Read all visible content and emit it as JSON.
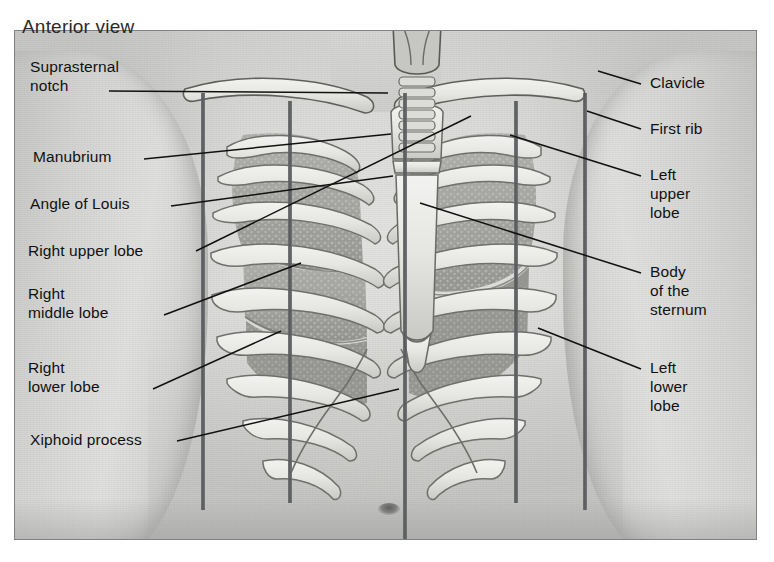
{
  "figure": {
    "title": "Anterior view",
    "view_label": "Anterior view",
    "frame_color": "#7e8285",
    "ink_color": "#111111",
    "reference_line_color": "#4e5052",
    "background_color": "#ffffff"
  },
  "labels_left": [
    {
      "id": "suprasternal-notch",
      "text": "Suprasternal\nnotch",
      "x": 30,
      "y": 57,
      "leader_from": [
        108,
        90
      ],
      "leader_to": [
        387,
        92
      ]
    },
    {
      "id": "manubrium",
      "text": "Manubrium",
      "x": 33,
      "y": 147,
      "leader_from": [
        143,
        158
      ],
      "leader_to": [
        390,
        133
      ]
    },
    {
      "id": "angle-of-louis",
      "text": "Angle of Louis",
      "x": 30,
      "y": 194,
      "leader_from": [
        170,
        205
      ],
      "leader_to": [
        392,
        175
      ]
    },
    {
      "id": "right-upper-lobe",
      "text": "Right upper lobe",
      "x": 28,
      "y": 241,
      "leader_from": [
        195,
        250
      ],
      "leader_to": [
        470,
        115
      ]
    },
    {
      "id": "right-middle-lobe",
      "text": "Right\nmiddle lobe",
      "x": 28,
      "y": 284,
      "leader_from": [
        163,
        314
      ],
      "leader_to": [
        300,
        262
      ]
    },
    {
      "id": "right-lower-lobe",
      "text": "Right\nlower lobe",
      "x": 28,
      "y": 358,
      "leader_from": [
        152,
        388
      ],
      "leader_to": [
        280,
        330
      ]
    },
    {
      "id": "xiphoid-process",
      "text": "Xiphoid process",
      "x": 30,
      "y": 430,
      "leader_from": [
        176,
        440
      ],
      "leader_to": [
        398,
        388
      ]
    }
  ],
  "labels_right": [
    {
      "id": "clavicle",
      "text": "Clavicle",
      "x": 650,
      "y": 73,
      "leader_from": [
        640,
        83
      ],
      "leader_to": [
        597,
        70
      ]
    },
    {
      "id": "first-rib",
      "text": "First rib",
      "x": 650,
      "y": 119,
      "leader_from": [
        640,
        128
      ],
      "leader_to": [
        586,
        110
      ]
    },
    {
      "id": "left-upper-lobe",
      "text": "Left\nupper\nlobe",
      "x": 650,
      "y": 165,
      "leader_from": [
        640,
        175
      ],
      "leader_to": [
        509,
        134
      ]
    },
    {
      "id": "body-of-sternum",
      "text": "Body\nof the\nsternum",
      "x": 650,
      "y": 262,
      "leader_from": [
        640,
        272
      ],
      "leader_to": [
        419,
        202
      ]
    },
    {
      "id": "left-lower-lobe",
      "text": "Left\nlower\nlobe",
      "x": 650,
      "y": 358,
      "leader_from": [
        640,
        368
      ],
      "leader_to": [
        537,
        327
      ]
    }
  ],
  "reference_lines": [
    {
      "id": "right-anterior-axillary-line",
      "x": 200,
      "y_top": 92,
      "y_bottom": 509
    },
    {
      "id": "right-midclavicular-line",
      "x": 287,
      "y_top": 100,
      "y_bottom": 502
    },
    {
      "id": "midsternal-line",
      "x": 402,
      "y_top": 92,
      "y_bottom": 520
    },
    {
      "id": "left-midclavicular-line",
      "x": 513,
      "y_top": 100,
      "y_bottom": 502
    },
    {
      "id": "left-anterior-axillary-line",
      "x": 582,
      "y_top": 92,
      "y_bottom": 509
    }
  ],
  "anatomy_parts": [
    {
      "id": "thyroid-cartilage",
      "name": "Thyroid cartilage"
    },
    {
      "id": "trachea",
      "name": "Trachea"
    },
    {
      "id": "clavicle-right",
      "name": "Right clavicle"
    },
    {
      "id": "clavicle-left",
      "name": "Left clavicle"
    },
    {
      "id": "manubrium",
      "name": "Manubrium"
    },
    {
      "id": "sternal-angle",
      "name": "Angle of Louis (sternal angle)"
    },
    {
      "id": "sternum-body",
      "name": "Body of the sternum"
    },
    {
      "id": "xiphoid-process",
      "name": "Xiphoid process"
    },
    {
      "id": "rib-cage-right",
      "name": "Right ribs"
    },
    {
      "id": "rib-cage-left",
      "name": "Left ribs"
    },
    {
      "id": "lung-right-upper",
      "name": "Right upper lobe"
    },
    {
      "id": "lung-right-middle",
      "name": "Right middle lobe"
    },
    {
      "id": "lung-right-lower",
      "name": "Right lower lobe"
    },
    {
      "id": "lung-left-upper",
      "name": "Left upper lobe"
    },
    {
      "id": "lung-left-lower",
      "name": "Left lower lobe"
    },
    {
      "id": "costal-margin",
      "name": "Costal margin"
    },
    {
      "id": "navel",
      "name": "Umbilicus"
    }
  ]
}
